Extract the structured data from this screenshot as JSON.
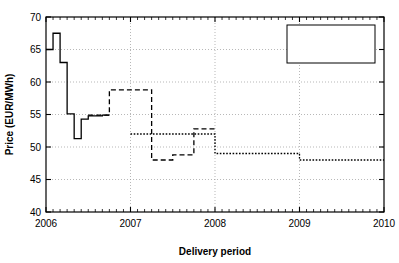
{
  "chart_data": {
    "type": "line",
    "title": "",
    "xlabel": "Delivery period",
    "ylabel": "Price (EUR/MWh)",
    "xlim": [
      2006,
      2010
    ],
    "ylim": [
      40,
      70
    ],
    "xticks": [
      2006,
      2007,
      2008,
      2009,
      2010
    ],
    "xticklabels": [
      "2006",
      "2007",
      "2008",
      "2009",
      "2010"
    ],
    "yticks": [
      40,
      45,
      50,
      55,
      60,
      65,
      70
    ],
    "yticklabels": [
      "40",
      "45",
      "50",
      "55",
      "60",
      "65",
      "70"
    ],
    "x_minor_tick_step": 0.08333,
    "grid": true,
    "grid_style": "dotted",
    "drawstyle": "steps-post",
    "legend_position": "upper right",
    "series": [
      {
        "name": "F1BM",
        "label": "F1BM",
        "linestyle": "solid",
        "color": "#000000",
        "x": [
          2006.0,
          2006.0833,
          2006.1667,
          2006.25,
          2006.3333,
          2006.4167,
          2006.5,
          2006.5833,
          2006.6667,
          2006.75
        ],
        "y": [
          65.0,
          67.5,
          63.0,
          55.1,
          51.3,
          54.3,
          54.8,
          54.8,
          54.9,
          54.9
        ]
      },
      {
        "name": "F1BQ",
        "label": "F1BQ",
        "linestyle": "dashed",
        "color": "#000000",
        "x": [
          2006.5,
          2006.75,
          2007.0,
          2007.25,
          2007.5,
          2007.75,
          2008.0
        ],
        "y": [
          54.9,
          58.8,
          58.8,
          48.0,
          48.8,
          52.8,
          52.8
        ]
      },
      {
        "name": "F1BY",
        "label": "F1BY",
        "linestyle": "dotted",
        "color": "#000000",
        "x": [
          2007.0,
          2007.75,
          2008.0,
          2009.0,
          2010.0
        ],
        "y": [
          52.0,
          52.0,
          49.0,
          48.0,
          48.0
        ]
      }
    ]
  },
  "axes": {
    "xlabel": "Delivery period",
    "ylabel": "Price (EUR/MWh)"
  },
  "legend": {
    "entries": [
      {
        "label": "F1BM",
        "style": "solid"
      },
      {
        "label": "F1BQ",
        "style": "dashed"
      },
      {
        "label": "F1BY",
        "style": "dotted"
      }
    ]
  },
  "colors": {
    "line": "#000000",
    "axis": "#000000",
    "grid": "#9a9a9a",
    "background": "#ffffff"
  }
}
